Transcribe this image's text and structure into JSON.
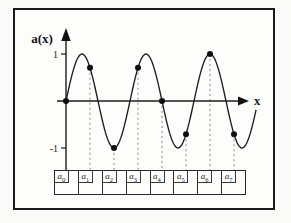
{
  "chart_data": {
    "type": "line",
    "title": "",
    "xlabel": "x",
    "ylabel": "a(x)",
    "x_range": [
      0,
      8
    ],
    "ylim": [
      -1,
      1
    ],
    "y_tick_labels": [
      "1",
      "-1"
    ],
    "y_tick_values": [
      1,
      -1
    ],
    "grid": false,
    "legend": false,
    "amplitude": 1,
    "frequency_cycles_per_unit": 0.375,
    "function": "a(x) = sin(3πx/4)",
    "curve_x_end": 7.95,
    "samples": {
      "x": [
        0,
        1,
        2,
        3,
        4,
        5,
        6,
        7
      ],
      "values": [
        0,
        0.707,
        -1,
        0.707,
        0,
        -0.707,
        1,
        -0.707
      ]
    }
  },
  "array_row": {
    "cells": [
      {
        "base": "a",
        "sub": "0"
      },
      {
        "base": "a",
        "sub": "1"
      },
      {
        "base": "a",
        "sub": "2"
      },
      {
        "base": "a",
        "sub": "3"
      },
      {
        "base": "a",
        "sub": "4"
      },
      {
        "base": "a",
        "sub": "5"
      },
      {
        "base": "a",
        "sub": "6"
      },
      {
        "base": "a",
        "sub": "7"
      }
    ]
  }
}
